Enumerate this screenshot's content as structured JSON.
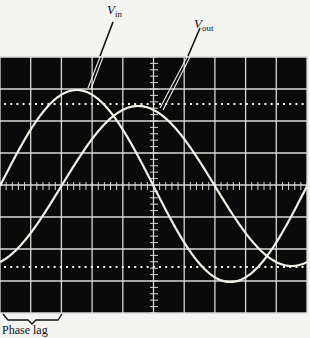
{
  "labels": {
    "vin_main": "V",
    "vin_sub": "in",
    "vout_main": "V",
    "vout_sub": "out",
    "phase_lag": "Phase lag"
  },
  "colors": {
    "screen": "#0a0a0a",
    "grid": "#d8d8d8",
    "trace": "#f2efe6",
    "background": "#f4f4f2"
  },
  "scope": {
    "divisions_x": 10,
    "divisions_y": 8,
    "left": 0,
    "right": 307,
    "top": 57,
    "bottom": 313,
    "center_x": 154,
    "center_y": 186,
    "dotted_levels_y": [
      104,
      267
    ]
  },
  "traces": [
    {
      "name": "Vin",
      "amplitude_div": 3.0,
      "phase_deg": 0
    },
    {
      "name": "Vout",
      "amplitude_div": 2.5,
      "phase_deg": -72
    }
  ]
}
